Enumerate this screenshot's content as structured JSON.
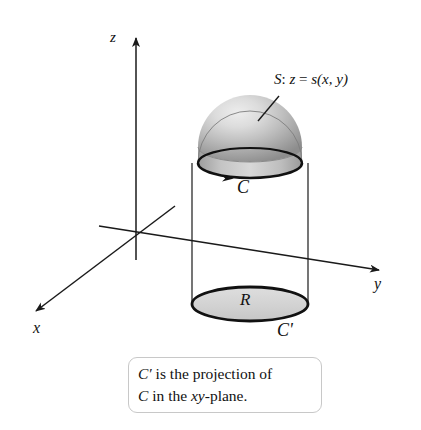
{
  "figure": {
    "background_color": "#ffffff",
    "ink_color": "#111111"
  },
  "axes": {
    "z_label": "z",
    "x_label": "x",
    "y_label": "y",
    "origin": {
      "x": 136,
      "y": 232
    },
    "z_tip": {
      "x": 136,
      "y": 34
    },
    "x_tip": {
      "x": 31,
      "y": 314
    },
    "y_tip": {
      "x": 384,
      "y": 272
    }
  },
  "surface": {
    "label": "S: z = s(x, y)",
    "label_parts": {
      "name": "S",
      "colon": ": ",
      "z": "z",
      "eq": " = ",
      "fn": "s(x, y)"
    },
    "leader_from": {
      "x": 258,
      "y": 121
    },
    "leader_to": {
      "x": 279,
      "y": 96
    },
    "highlight_color": "#e6e6e6",
    "mid_color": "#b5b5b5",
    "shadow_color": "#8e8e8e"
  },
  "curve_top": {
    "label": "C",
    "description": "oriented boundary curve on the surface",
    "center": {
      "x": 250,
      "y": 163
    },
    "rx": 52,
    "ry": 15,
    "stroke_color": "#111111",
    "stroke_width": 2.6,
    "arrow_direction": "counterclockwise-from-above"
  },
  "region": {
    "label": "R",
    "description": "projected region in the xy-plane",
    "center": {
      "x": 250,
      "y": 304
    },
    "rx": 58,
    "ry": 17,
    "fill_color": "#d6d6d6",
    "stroke_color": "#111111",
    "stroke_width": 2.8
  },
  "curve_projection": {
    "label": "C'",
    "description": "projection of C in the xy-plane"
  },
  "cylinder": {
    "left_x": 198,
    "right_x": 302,
    "top_y": 163,
    "bottom_y": 304,
    "stroke_color": "#1a1a1a",
    "stroke_width": 1.2
  },
  "caption": {
    "line1_prefix": "C′",
    "line1_rest": " is the projection of",
    "line2_prefix": "C",
    "line2_mid": " in the ",
    "line2_italic": "xy",
    "line2_suffix": "-plane.",
    "full_text": "C′ is the projection of C in the xy-plane.",
    "border_color": "#c8c8c8"
  }
}
